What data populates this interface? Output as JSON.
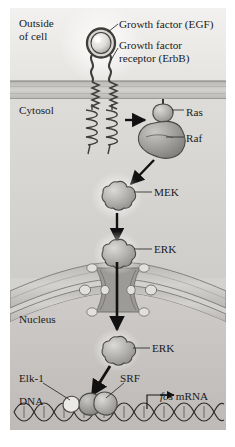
{
  "figure": {
    "type": "biological-pathway-diagram"
  },
  "compartments": {
    "outside": "Outside\nof cell",
    "cytosol": "Cytosol",
    "nucleus": "Nucleus"
  },
  "labels": {
    "egf": "Growth factor (EGF)",
    "receptor": "Growth factor\nreceptor (ErbB)",
    "ras": "Ras",
    "raf": "Raf",
    "mek": "MEK",
    "erk_cytosol": "ERK",
    "erk_nucleus": "ERK",
    "elk1": "Elk-1",
    "srf": "SRF",
    "dna": "DNA",
    "fos_italic": "fos",
    "fos_rest": " mRNA"
  },
  "colors": {
    "background": "#ffffff",
    "outside_fill": "#eceae7",
    "membrane_fill": "#c9c7c4",
    "membrane_line": "#8a8885",
    "cytosol_fill": "#d8d6d3",
    "nucleus_fill": "#c4c2bf",
    "protein_fill": "#b0aeab",
    "protein_stroke": "#4a4845",
    "text": "#1a1a1a",
    "arrow": "#111111",
    "leader": "#2b2b2b"
  },
  "pathway_steps": [
    {
      "from": "EGF",
      "to": "Growth factor receptor (ErbB)",
      "relation": "binds"
    },
    {
      "from": "Growth factor receptor (ErbB)",
      "to": "Ras",
      "relation": "activates"
    },
    {
      "from": "Ras",
      "to": "Raf",
      "relation": "activates"
    },
    {
      "from": "Raf",
      "to": "MEK",
      "relation": "activates"
    },
    {
      "from": "MEK",
      "to": "ERK",
      "relation": "activates"
    },
    {
      "from": "ERK",
      "to": "nucleus",
      "relation": "translocates through nuclear pore"
    },
    {
      "from": "ERK",
      "to": "Elk-1 / SRF",
      "relation": "phosphorylates"
    },
    {
      "from": "Elk-1 / SRF",
      "to": "fos mRNA",
      "relation": "transcribes"
    }
  ]
}
